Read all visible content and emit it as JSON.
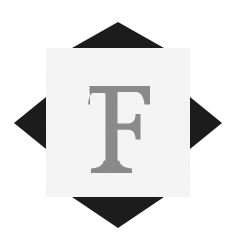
{
  "artwork": {
    "title": "Letter F monogram on square with four black triangles",
    "letter": "F",
    "letter_color": "#8a8a8a",
    "background_color": "#ffffff",
    "square_color": "#f6f6f6",
    "triangle_color": "#1c1c1c",
    "canvas": {
      "width": 235,
      "height": 249
    },
    "square": {
      "x": 46,
      "y": 48,
      "width": 144,
      "height": 149
    },
    "letter_box": {
      "x": 88,
      "y": 84,
      "width": 62,
      "height": 90
    },
    "letter_font_size": 112,
    "triangles": [
      {
        "name": "top",
        "direction": "up",
        "points": "72,48 118,22 164,48"
      },
      {
        "name": "right",
        "direction": "right",
        "points": "190,97 222,123 190,149"
      },
      {
        "name": "bottom",
        "direction": "down",
        "points": "72,197 164,197 118,228"
      },
      {
        "name": "left",
        "direction": "left",
        "points": "46,97 46,149 14,123"
      }
    ]
  }
}
